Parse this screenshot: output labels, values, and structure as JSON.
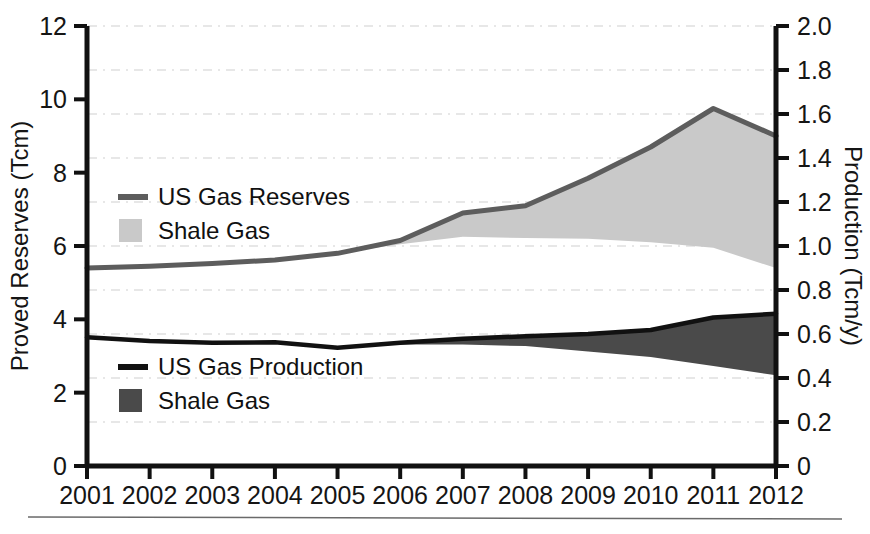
{
  "chart_data": {
    "type": "area",
    "title": "",
    "x": [
      2001,
      2002,
      2003,
      2004,
      2005,
      2006,
      2007,
      2008,
      2009,
      2010,
      2011,
      2012
    ],
    "categories": [
      "2001",
      "2002",
      "2003",
      "2004",
      "2005",
      "2006",
      "2007",
      "2008",
      "2009",
      "2010",
      "2011",
      "2012"
    ],
    "xlabel": "",
    "ylabel": "Proved Reserves (Tcm)",
    "y2label": "Production (Tcm/y)",
    "ylim": [
      0,
      12
    ],
    "y2lim": [
      0,
      2.0
    ],
    "yticks": [
      "0",
      "2",
      "4",
      "6",
      "8",
      "10",
      "12"
    ],
    "y2ticks": [
      "0",
      "0.2",
      "0.4",
      "0.6",
      "0.8",
      "1.0",
      "1.2",
      "1.4",
      "1.6",
      "1.8",
      "2.0"
    ],
    "grid": "horizontal-dashed",
    "legend_position": "inside-left",
    "series": [
      {
        "name": "US Gas Reserves",
        "axis": "left",
        "type": "line",
        "color": "#5d5d5d",
        "values": [
          5.4,
          5.45,
          5.52,
          5.62,
          5.8,
          6.15,
          6.9,
          7.1,
          7.85,
          8.7,
          9.75,
          9.0
        ]
      },
      {
        "name": "Shale Gas",
        "axis": "left",
        "type": "area-fill-under-reserves",
        "color": "#c9c9c9",
        "baseline_values": [
          5.4,
          5.45,
          5.52,
          5.62,
          5.8,
          6.05,
          6.25,
          6.22,
          6.2,
          6.1,
          5.95,
          5.4
        ]
      },
      {
        "name": "US Gas Production",
        "axis": "right",
        "type": "line",
        "color": "#111111",
        "values": [
          0.585,
          0.568,
          0.56,
          0.562,
          0.537,
          0.56,
          0.578,
          0.59,
          0.6,
          0.618,
          0.675,
          0.692
        ]
      },
      {
        "name": "Shale Gas",
        "axis": "right",
        "type": "area-fill-under-production",
        "color": "#4a4a4a",
        "baseline_values": [
          0.585,
          0.568,
          0.56,
          0.562,
          0.537,
          0.552,
          0.552,
          0.545,
          0.52,
          0.495,
          0.455,
          0.412
        ]
      }
    ],
    "legend_blocks": [
      {
        "items": [
          {
            "label": "US Gas Reserves",
            "marker": "line",
            "color": "#5d5d5d"
          },
          {
            "label": "Shale Gas",
            "marker": "swatch",
            "color": "#c9c9c9"
          }
        ]
      },
      {
        "items": [
          {
            "label": "US Gas Production",
            "marker": "line",
            "color": "#111111"
          },
          {
            "label": "Shale Gas",
            "marker": "swatch",
            "color": "#4a4a4a"
          }
        ]
      }
    ]
  },
  "axes": {
    "left_title": "Proved Reserves (Tcm)",
    "right_title": "Production (Tcm/y)",
    "left_ticks": [
      "12",
      "10",
      "8",
      "6",
      "4",
      "2",
      "0"
    ],
    "right_ticks": [
      "2.0",
      "1.8",
      "1.6",
      "1.4",
      "1.2",
      "1.0",
      "0.8",
      "0.6",
      "0.4",
      "0.2",
      "0"
    ],
    "x_ticks": [
      "2001",
      "2002",
      "2003",
      "2004",
      "2005",
      "2006",
      "2007",
      "2008",
      "2009",
      "2010",
      "2011",
      "2012"
    ]
  },
  "legend": {
    "reserves_line_label": "US Gas Reserves",
    "reserves_shale_label": "Shale Gas",
    "production_line_label": "US Gas Production",
    "production_shale_label": "Shale Gas"
  },
  "colors": {
    "reserves_line": "#5d5d5d",
    "reserves_shale_fill": "#c9c9c9",
    "production_line": "#111111",
    "production_shale_fill": "#4a4a4a",
    "axis": "#111111",
    "grid": "#cfcfcf",
    "background": "#ffffff"
  }
}
